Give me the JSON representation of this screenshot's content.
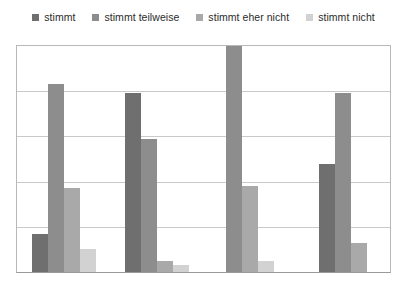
{
  "legend": {
    "position": "top-center",
    "items": [
      {
        "label": "stimmt",
        "color": "#6f6f6f",
        "icon": "legend-square-icon"
      },
      {
        "label": "stimmt teilweise",
        "color": "#8d8d8d",
        "icon": "legend-square-icon"
      },
      {
        "label": "stimmt eher nicht",
        "color": "#a9a9a9",
        "icon": "legend-square-icon"
      },
      {
        "label": "stimmt nicht",
        "color": "#d2d2d2",
        "icon": "legend-square-icon"
      }
    ]
  },
  "chart_data": {
    "type": "bar",
    "title": "",
    "subtitle": "",
    "xlabel": "",
    "ylabel": "",
    "ylim": [
      0,
      100
    ],
    "grid": true,
    "gridlines": [
      20,
      40,
      60,
      80,
      100
    ],
    "legend_position": "top-center",
    "axis_tick_labels": [],
    "categories": [
      "1",
      "2",
      "3",
      "4"
    ],
    "series": [
      {
        "name": "stimmt",
        "color": "#6f6f6f",
        "values": [
          17,
          79,
          0,
          48
        ]
      },
      {
        "name": "stimmt teilweise",
        "color": "#8d8d8d",
        "values": [
          83,
          59,
          100,
          79
        ]
      },
      {
        "name": "stimmt eher nicht",
        "color": "#a9a9a9",
        "values": [
          37,
          5,
          38,
          13
        ]
      },
      {
        "name": "stimmt nicht",
        "color": "#d2d2d2",
        "values": [
          10,
          3,
          5,
          0
        ]
      }
    ]
  },
  "colors": {
    "background": "#ffffff",
    "border": "#b8b8b8",
    "gridline": "#c9c9c9",
    "axis": "#9a9a9a",
    "text": "#2b2b2b"
  }
}
